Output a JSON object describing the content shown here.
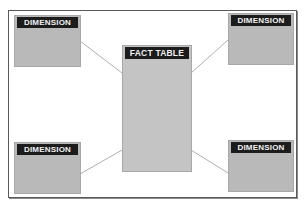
{
  "diagram": {
    "type": "star-schema",
    "frame_color": "#5a5a5a",
    "box_fill": "#b9b9b9",
    "header_fill": "#1c1c1c",
    "header_text_color": "#f2f2f2",
    "connector_color": "#9a9a9a",
    "fact_table": {
      "label": "FACT TABLE"
    },
    "dimensions": [
      {
        "position": "top-left",
        "label": "DIMENSION"
      },
      {
        "position": "top-right",
        "label": "DIMENSION"
      },
      {
        "position": "bottom-left",
        "label": "DIMENSION"
      },
      {
        "position": "bottom-right",
        "label": "DIMENSION"
      }
    ],
    "connections": [
      {
        "from": "top-left",
        "to": "fact_table"
      },
      {
        "from": "top-right",
        "to": "fact_table"
      },
      {
        "from": "bottom-left",
        "to": "fact_table"
      },
      {
        "from": "bottom-right",
        "to": "fact_table"
      }
    ]
  }
}
